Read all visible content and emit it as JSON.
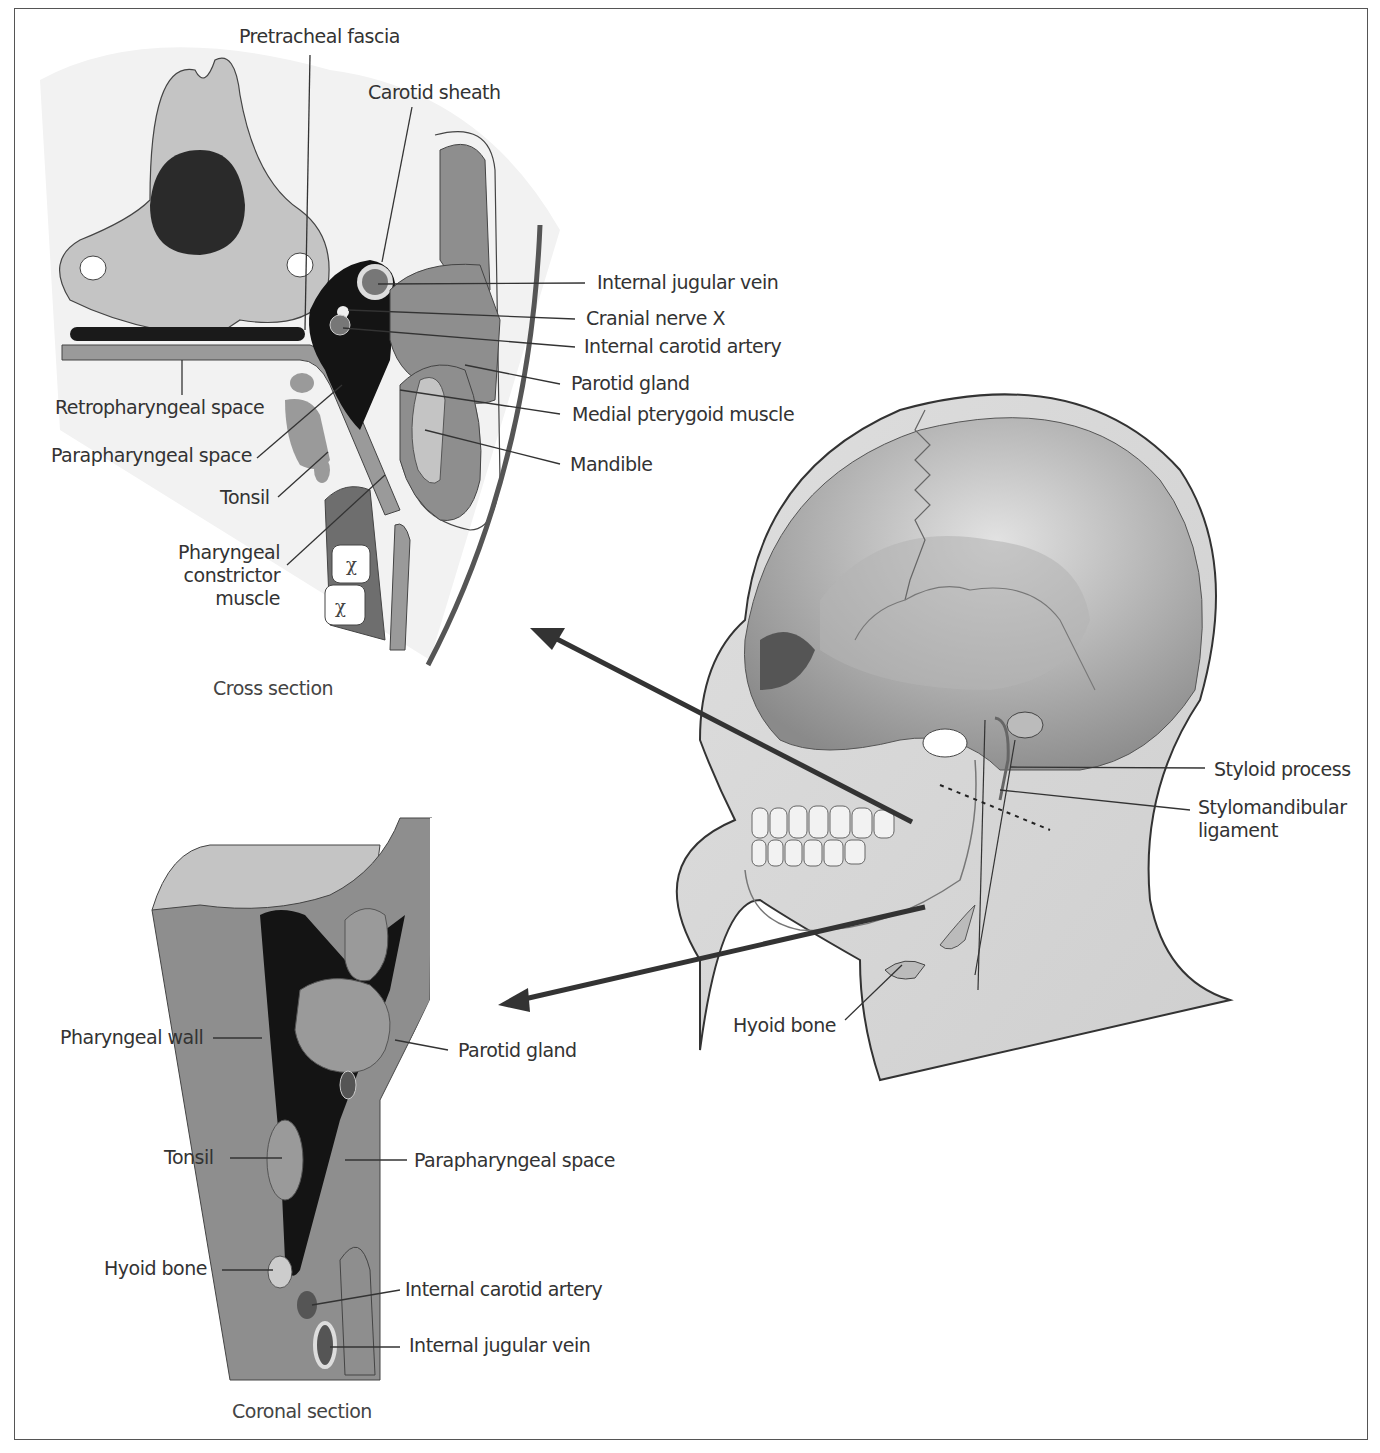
{
  "figure": {
    "panels": {
      "cross_section": {
        "caption": "Cross section",
        "labels": {
          "pretracheal_fascia": "Pretracheal fascia",
          "carotid_sheath": "Carotid sheath",
          "internal_jugular_vein": "Internal jugular vein",
          "cranial_nerve_x": "Cranial nerve X",
          "internal_carotid_artery": "Internal carotid artery",
          "parotid_gland": "Parotid gland",
          "medial_pterygoid_muscle": "Medial pterygoid muscle",
          "mandible": "Mandible",
          "retropharyngeal_space": "Retropharyngeal space",
          "parapharyngeal_space": "Parapharyngeal space",
          "tonsil": "Tonsil",
          "pharyngeal_constrictor_muscle_l1": "Pharyngeal",
          "pharyngeal_constrictor_muscle_l2": "constrictor",
          "pharyngeal_constrictor_muscle_l3": "muscle"
        }
      },
      "head_lateral": {
        "labels": {
          "styloid_process": "Styloid process",
          "stylomandibular_ligament_l1": "Stylomandibular",
          "stylomandibular_ligament_l2": "ligament",
          "hyoid_bone": "Hyoid bone"
        }
      },
      "coronal_section": {
        "caption": "Coronal section",
        "labels": {
          "pharyngeal_wall": "Pharyngeal wall",
          "parotid_gland": "Parotid gland",
          "tonsil": "Tonsil",
          "parapharyngeal_space": "Parapharyngeal space",
          "hyoid_bone": "Hyoid bone",
          "internal_carotid_artery": "Internal carotid artery",
          "internal_jugular_vein": "Internal jugular vein"
        }
      }
    },
    "colors": {
      "bone": "#c4c4c4",
      "muscle": "#8e8e8e",
      "dark": "#1a1a1a",
      "skin": "#d9d9d9",
      "line": "#333333"
    }
  }
}
